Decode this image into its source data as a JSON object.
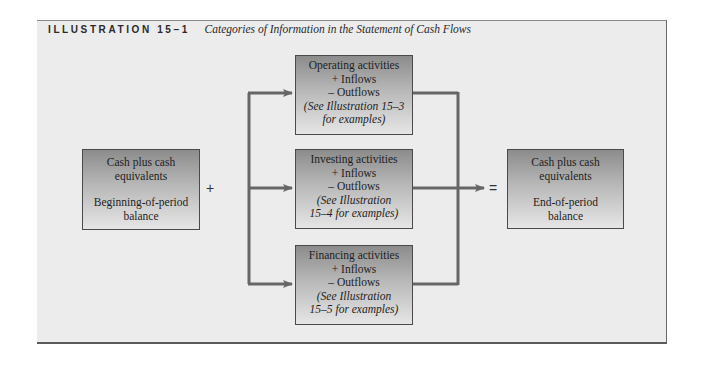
{
  "header": {
    "label": "ILLUSTRATION 15–1",
    "title": "Categories of Information in the Statement of Cash Flows"
  },
  "beginning_box": {
    "line1": "Cash plus cash",
    "line2": "equivalents",
    "line3": "Beginning-of-period",
    "line4": "balance"
  },
  "plus_sign": "+",
  "equals_sign": "=",
  "activities": [
    {
      "title": "Operating activities",
      "inflows": "+ Inflows",
      "outflows": "– Outflows",
      "note1": "(See Illustration 15–3",
      "note2": "for examples)"
    },
    {
      "title": "Investing activities",
      "inflows": "+ Inflows",
      "outflows": "– Outflows",
      "note1": "(See Illustration",
      "note2": "15–4 for examples)"
    },
    {
      "title": "Financing activities",
      "inflows": "+ Inflows",
      "outflows": "– Outflows",
      "note1": "(See Illustration",
      "note2": "15–5 for examples)"
    }
  ],
  "ending_box": {
    "line1": "Cash plus cash",
    "line2": "equivalents",
    "line3": "End-of-period",
    "line4": "balance"
  },
  "colors": {
    "panel": "#ececec",
    "arrow": "#666666",
    "box_dark": "#8c8c8c",
    "box_light": "#e6e6e6"
  }
}
